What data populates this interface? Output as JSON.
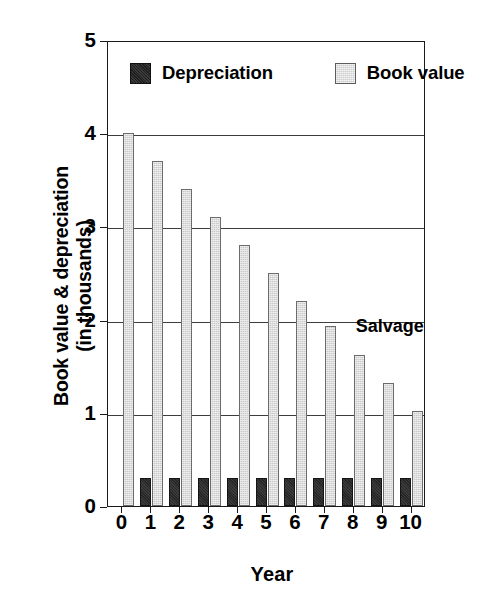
{
  "chart_data": {
    "type": "bar",
    "title": "",
    "xlabel": "Year",
    "ylabel_lines": [
      "Book value & depreciation",
      "(in thousands)"
    ],
    "ylabel": "Book value & depreciation (in thousands)",
    "categories": [
      "0",
      "1",
      "2",
      "3",
      "4",
      "5",
      "6",
      "7",
      "8",
      "9",
      "10"
    ],
    "series": [
      {
        "name": "Depreciation",
        "color": "#1f1f1f",
        "values": [
          0,
          0.3,
          0.3,
          0.3,
          0.3,
          0.3,
          0.3,
          0.3,
          0.3,
          0.3,
          0.3
        ]
      },
      {
        "name": "Book value",
        "color": "#cfcfcf",
        "values": [
          4.0,
          3.7,
          3.4,
          3.1,
          2.8,
          2.5,
          2.2,
          1.93,
          1.62,
          1.32,
          1.02
        ]
      }
    ],
    "ylim": [
      0,
      5
    ],
    "yticks": [
      "0",
      "1",
      "2",
      "3",
      "4",
      "5"
    ],
    "ytick_values": [
      0,
      1,
      2,
      3,
      4,
      5
    ],
    "grid": true,
    "grid_axis": "y",
    "legend_position": "upper-left-inside",
    "annotations": [
      {
        "text": "Salvage",
        "x_category": "8",
        "y_value": 1.95
      }
    ]
  },
  "legend": {
    "items": [
      {
        "label": "Depreciation",
        "swatch": "dark-swatch-icon"
      },
      {
        "label": "Book value",
        "swatch": "light-swatch-icon"
      }
    ]
  },
  "colors": {
    "depreciation": "#1f1f1f",
    "book_value": "#cfcfcf",
    "axis": "#1a1a1a",
    "grid": "#3d3d3d",
    "background": "#ffffff"
  }
}
